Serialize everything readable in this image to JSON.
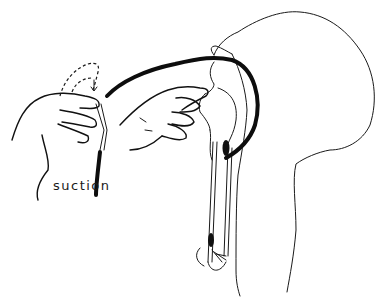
{
  "illustration": {
    "subject": "nasotracheal suction catheter insertion",
    "label": "suction",
    "colors": {
      "ink": "#111111",
      "background": "#ffffff"
    }
  }
}
